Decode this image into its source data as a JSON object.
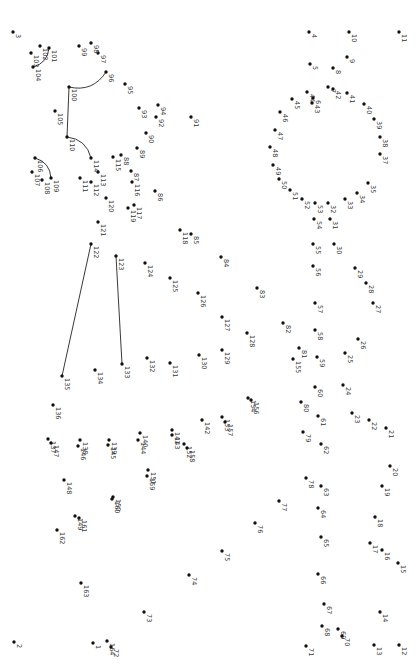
{
  "puzzle": {
    "type": "connect-the-dots",
    "orientation": "rotated-90-clockwise",
    "dot_color": "#111111",
    "line_color": "#222222",
    "label_color": "#333333",
    "points": [
      {
        "n": "1",
        "x": 93,
        "y": 643
      },
      {
        "n": "2",
        "x": 14,
        "y": 642
      },
      {
        "n": "3",
        "x": 13,
        "y": 32
      },
      {
        "n": "4",
        "x": 309,
        "y": 32
      },
      {
        "n": "5",
        "x": 310,
        "y": 64
      },
      {
        "n": "6",
        "x": 313,
        "y": 98
      },
      {
        "n": "7",
        "x": 328,
        "y": 87
      },
      {
        "n": "8",
        "x": 333,
        "y": 68
      },
      {
        "n": "9",
        "x": 347,
        "y": 57
      },
      {
        "n": "10",
        "x": 349,
        "y": 32
      },
      {
        "n": "11",
        "x": 399,
        "y": 32
      },
      {
        "n": "12",
        "x": 399,
        "y": 645
      },
      {
        "n": "13",
        "x": 374,
        "y": 645
      },
      {
        "n": "14",
        "x": 380,
        "y": 612
      },
      {
        "n": "15",
        "x": 398,
        "y": 563
      },
      {
        "n": "16",
        "x": 382,
        "y": 550
      },
      {
        "n": "17",
        "x": 370,
        "y": 543
      },
      {
        "n": "18",
        "x": 375,
        "y": 517
      },
      {
        "n": "19",
        "x": 382,
        "y": 486
      },
      {
        "n": "20",
        "x": 390,
        "y": 466
      },
      {
        "n": "21",
        "x": 386,
        "y": 428
      },
      {
        "n": "22",
        "x": 369,
        "y": 420
      },
      {
        "n": "23",
        "x": 352,
        "y": 413
      },
      {
        "n": "24",
        "x": 343,
        "y": 385
      },
      {
        "n": "25",
        "x": 345,
        "y": 353
      },
      {
        "n": "26",
        "x": 358,
        "y": 339
      },
      {
        "n": "27",
        "x": 373,
        "y": 303
      },
      {
        "n": "28",
        "x": 366,
        "y": 283
      },
      {
        "n": "29",
        "x": 355,
        "y": 268
      },
      {
        "n": "30",
        "x": 334,
        "y": 244
      },
      {
        "n": "31",
        "x": 330,
        "y": 219
      },
      {
        "n": "32",
        "x": 328,
        "y": 203
      },
      {
        "n": "33",
        "x": 345,
        "y": 199
      },
      {
        "n": "34",
        "x": 357,
        "y": 193
      },
      {
        "n": "35",
        "x": 368,
        "y": 183
      },
      {
        "n": "37",
        "x": 380,
        "y": 154
      },
      {
        "n": "38",
        "x": 380,
        "y": 137
      },
      {
        "n": "39",
        "x": 374,
        "y": 119
      },
      {
        "n": "40",
        "x": 364,
        "y": 104
      },
      {
        "n": "41",
        "x": 347,
        "y": 93
      },
      {
        "n": "42",
        "x": 333,
        "y": 89
      },
      {
        "n": "43",
        "x": 312,
        "y": 103
      },
      {
        "n": "44",
        "x": 307,
        "y": 92
      },
      {
        "n": "45",
        "x": 292,
        "y": 99
      },
      {
        "n": "46",
        "x": 280,
        "y": 112
      },
      {
        "n": "47",
        "x": 275,
        "y": 130
      },
      {
        "n": "48",
        "x": 270,
        "y": 147
      },
      {
        "n": "49",
        "x": 273,
        "y": 165
      },
      {
        "n": "50",
        "x": 279,
        "y": 179
      },
      {
        "n": "51",
        "x": 290,
        "y": 190
      },
      {
        "n": "52",
        "x": 302,
        "y": 199
      },
      {
        "n": "53",
        "x": 315,
        "y": 203
      },
      {
        "n": "54",
        "x": 314,
        "y": 219
      },
      {
        "n": "55",
        "x": 313,
        "y": 244
      },
      {
        "n": "56",
        "x": 313,
        "y": 266
      },
      {
        "n": "57",
        "x": 315,
        "y": 303
      },
      {
        "n": "58",
        "x": 315,
        "y": 330
      },
      {
        "n": "59",
        "x": 317,
        "y": 357
      },
      {
        "n": "60",
        "x": 315,
        "y": 387
      },
      {
        "n": "61",
        "x": 318,
        "y": 416
      },
      {
        "n": "62",
        "x": 321,
        "y": 444
      },
      {
        "n": "63",
        "x": 321,
        "y": 486
      },
      {
        "n": "64",
        "x": 318,
        "y": 508
      },
      {
        "n": "65",
        "x": 321,
        "y": 537
      },
      {
        "n": "66",
        "x": 318,
        "y": 574
      },
      {
        "n": "67",
        "x": 324,
        "y": 604
      },
      {
        "n": "68",
        "x": 322,
        "y": 626
      },
      {
        "n": "69",
        "x": 338,
        "y": 629
      },
      {
        "n": "70",
        "x": 342,
        "y": 636
      },
      {
        "n": "71",
        "x": 306,
        "y": 646
      },
      {
        "n": "72",
        "x": 111,
        "y": 647
      },
      {
        "n": "73",
        "x": 144,
        "y": 612
      },
      {
        "n": "74",
        "x": 189,
        "y": 575
      },
      {
        "n": "75",
        "x": 222,
        "y": 551
      },
      {
        "n": "76",
        "x": 255,
        "y": 523
      },
      {
        "n": "77",
        "x": 279,
        "y": 501
      },
      {
        "n": "78",
        "x": 306,
        "y": 478
      },
      {
        "n": "79",
        "x": 303,
        "y": 432
      },
      {
        "n": "80",
        "x": 301,
        "y": 402
      },
      {
        "n": "81",
        "x": 299,
        "y": 348
      },
      {
        "n": "82",
        "x": 283,
        "y": 323
      },
      {
        "n": "83",
        "x": 257,
        "y": 288
      },
      {
        "n": "84",
        "x": 221,
        "y": 257
      },
      {
        "n": "85",
        "x": 191,
        "y": 234
      },
      {
        "n": "86",
        "x": 155,
        "y": 191
      },
      {
        "n": "87",
        "x": 131,
        "y": 171
      },
      {
        "n": "88",
        "x": 121,
        "y": 155
      },
      {
        "n": "89",
        "x": 137,
        "y": 148
      },
      {
        "n": "90",
        "x": 146,
        "y": 133
      },
      {
        "n": "91",
        "x": 191,
        "y": 117
      },
      {
        "n": "92",
        "x": 156,
        "y": 117
      },
      {
        "n": "93",
        "x": 139,
        "y": 108
      },
      {
        "n": "94",
        "x": 158,
        "y": 105
      },
      {
        "n": "95",
        "x": 125,
        "y": 84
      },
      {
        "n": "96",
        "x": 106,
        "y": 72
      },
      {
        "n": "97",
        "x": 98,
        "y": 53
      },
      {
        "n": "98",
        "x": 91,
        "y": 43
      },
      {
        "n": "99",
        "x": 79,
        "y": 46
      },
      {
        "n": "100",
        "x": 69,
        "y": 87
      },
      {
        "n": "101",
        "x": 49,
        "y": 48
      },
      {
        "n": "102",
        "x": 40,
        "y": 46
      },
      {
        "n": "103",
        "x": 31,
        "y": 53
      },
      {
        "n": "104",
        "x": 33,
        "y": 67
      },
      {
        "n": "105",
        "x": 55,
        "y": 111
      },
      {
        "n": "106",
        "x": 35,
        "y": 158
      },
      {
        "n": "107",
        "x": 32,
        "y": 172
      },
      {
        "n": "108",
        "x": 42,
        "y": 180
      },
      {
        "n": "109",
        "x": 51,
        "y": 178
      },
      {
        "n": "110",
        "x": 67,
        "y": 137
      },
      {
        "n": "111",
        "x": 80,
        "y": 178
      },
      {
        "n": "112",
        "x": 91,
        "y": 182
      },
      {
        "n": "113",
        "x": 98,
        "y": 172
      },
      {
        "n": "114",
        "x": 91,
        "y": 158
      },
      {
        "n": "115",
        "x": 113,
        "y": 157
      },
      {
        "n": "116",
        "x": 132,
        "y": 182
      },
      {
        "n": "117",
        "x": 134,
        "y": 205
      },
      {
        "n": "118",
        "x": 180,
        "y": 230
      },
      {
        "n": "119",
        "x": 128,
        "y": 208
      },
      {
        "n": "120",
        "x": 106,
        "y": 198
      },
      {
        "n": "121",
        "x": 98,
        "y": 222
      },
      {
        "n": "122",
        "x": 91,
        "y": 244
      },
      {
        "n": "123",
        "x": 116,
        "y": 256
      },
      {
        "n": "124",
        "x": 145,
        "y": 263
      },
      {
        "n": "125",
        "x": 170,
        "y": 278
      },
      {
        "n": "126",
        "x": 198,
        "y": 293
      },
      {
        "n": "127",
        "x": 222,
        "y": 317
      },
      {
        "n": "128",
        "x": 247,
        "y": 333
      },
      {
        "n": "129",
        "x": 222,
        "y": 350
      },
      {
        "n": "130",
        "x": 199,
        "y": 355
      },
      {
        "n": "131",
        "x": 170,
        "y": 363
      },
      {
        "n": "132",
        "x": 147,
        "y": 358
      },
      {
        "n": "133",
        "x": 122,
        "y": 364
      },
      {
        "n": "134",
        "x": 95,
        "y": 370
      },
      {
        "n": "135",
        "x": 62,
        "y": 376
      },
      {
        "n": "136",
        "x": 53,
        "y": 405
      },
      {
        "n": "137",
        "x": 48,
        "y": 439
      },
      {
        "n": "138",
        "x": 80,
        "y": 440
      },
      {
        "n": "139",
        "x": 109,
        "y": 440
      },
      {
        "n": "140",
        "x": 140,
        "y": 433
      },
      {
        "n": "141",
        "x": 172,
        "y": 430
      },
      {
        "n": "142",
        "x": 202,
        "y": 420
      },
      {
        "n": "143",
        "x": 172,
        "y": 435
      },
      {
        "n": "144",
        "x": 138,
        "y": 440
      },
      {
        "n": "145",
        "x": 108,
        "y": 445
      },
      {
        "n": "146",
        "x": 78,
        "y": 446
      },
      {
        "n": "147",
        "x": 51,
        "y": 443
      },
      {
        "n": "148",
        "x": 64,
        "y": 480
      },
      {
        "n": "149",
        "x": 75,
        "y": 516
      },
      {
        "n": "150",
        "x": 113,
        "y": 497
      },
      {
        "n": "151",
        "x": 148,
        "y": 470
      },
      {
        "n": "152",
        "x": 184,
        "y": 444
      },
      {
        "n": "153",
        "x": 222,
        "y": 417
      },
      {
        "n": "154",
        "x": 248,
        "y": 398
      },
      {
        "n": "155",
        "x": 293,
        "y": 359
      },
      {
        "n": "156",
        "x": 251,
        "y": 400
      },
      {
        "n": "157",
        "x": 225,
        "y": 422
      },
      {
        "n": "158",
        "x": 187,
        "y": 448
      },
      {
        "n": "159",
        "x": 147,
        "y": 476
      },
      {
        "n": "160",
        "x": 112,
        "y": 499
      },
      {
        "n": "161",
        "x": 79,
        "y": 518
      },
      {
        "n": "162",
        "x": 57,
        "y": 530
      },
      {
        "n": "163",
        "x": 81,
        "y": 583
      },
      {
        "n": "164",
        "x": 107,
        "y": 641
      }
    ],
    "drawn_segments": [
      {
        "from": "96",
        "to": "100"
      },
      {
        "from": "100",
        "to": "110"
      },
      {
        "from": "110",
        "to": "114"
      },
      {
        "from": "101",
        "to": "104"
      },
      {
        "from": "106",
        "to": "109"
      },
      {
        "from": "122",
        "to": "135"
      },
      {
        "from": "123",
        "to": "133"
      }
    ]
  }
}
